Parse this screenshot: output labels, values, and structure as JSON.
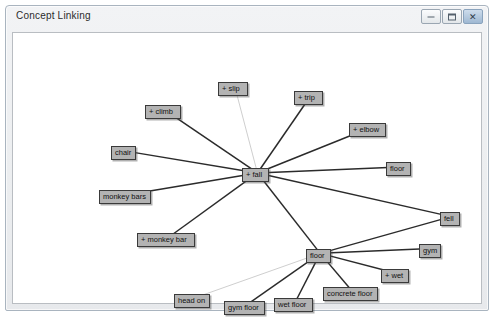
{
  "window": {
    "title": "Concept Linking",
    "controls": [
      {
        "name": "minimize",
        "label": "–"
      },
      {
        "name": "maximize",
        "label": "□"
      },
      {
        "name": "close",
        "label": "✕"
      }
    ]
  },
  "graph": {
    "nodes": [
      {
        "id": "slip",
        "label": "+ slip",
        "x": 212,
        "y": 76,
        "w": 30,
        "hub": false
      },
      {
        "id": "trip",
        "label": "+ trip",
        "x": 288,
        "y": 85,
        "w": 29,
        "hub": false
      },
      {
        "id": "climb",
        "label": "+ climb",
        "x": 139,
        "y": 99,
        "w": 36,
        "hub": false
      },
      {
        "id": "elbow",
        "label": "+ elbow",
        "x": 343,
        "y": 117,
        "w": 37,
        "hub": false
      },
      {
        "id": "chair",
        "label": "chair",
        "x": 105,
        "y": 140,
        "w": 25,
        "hub": false
      },
      {
        "id": "fall",
        "label": "+ fall",
        "x": 236,
        "y": 162,
        "w": 27,
        "hub": true
      },
      {
        "id": "floor_right",
        "label": "floor",
        "x": 380,
        "y": 156,
        "w": 25,
        "hub": false
      },
      {
        "id": "monkey_bars",
        "label": "monkey bars",
        "x": 93,
        "y": 184,
        "w": 52,
        "hub": false
      },
      {
        "id": "monkey_bar",
        "label": "+ monkey bar",
        "x": 131,
        "y": 227,
        "w": 58,
        "hub": false
      },
      {
        "id": "fell",
        "label": "fell",
        "x": 434,
        "y": 206,
        "w": 20,
        "hub": false
      },
      {
        "id": "gym",
        "label": "gym",
        "x": 413,
        "y": 238,
        "w": 22,
        "hub": false
      },
      {
        "id": "floor_hub",
        "label": "floor",
        "x": 300,
        "y": 243,
        "w": 25,
        "hub": true
      },
      {
        "id": "wet",
        "label": "+ wet",
        "x": 375,
        "y": 263,
        "w": 28,
        "hub": false
      },
      {
        "id": "concrete_floor",
        "label": "concrete floor",
        "x": 317,
        "y": 281,
        "w": 55,
        "hub": false
      },
      {
        "id": "wet_floor",
        "label": "wet floor",
        "x": 268,
        "y": 292,
        "w": 39,
        "hub": false
      },
      {
        "id": "gym_floor",
        "label": "gym floor",
        "x": 218,
        "y": 295,
        "w": 41,
        "hub": false
      },
      {
        "id": "head_on",
        "label": "head on",
        "x": 168,
        "y": 288,
        "w": 36,
        "hub": false
      }
    ],
    "edges": [
      {
        "from": "fall",
        "to": "slip",
        "weight": "thin"
      },
      {
        "from": "fall",
        "to": "trip",
        "weight": "thick"
      },
      {
        "from": "fall",
        "to": "climb",
        "weight": "thick"
      },
      {
        "from": "fall",
        "to": "elbow",
        "weight": "thick"
      },
      {
        "from": "fall",
        "to": "chair",
        "weight": "thick"
      },
      {
        "from": "fall",
        "to": "floor_right",
        "weight": "thick"
      },
      {
        "from": "fall",
        "to": "monkey_bars",
        "weight": "thick"
      },
      {
        "from": "fall",
        "to": "monkey_bar",
        "weight": "thick"
      },
      {
        "from": "fall",
        "to": "floor_hub",
        "weight": "thick"
      },
      {
        "from": "fall",
        "to": "fell",
        "weight": "thick"
      },
      {
        "from": "floor_hub",
        "to": "fell",
        "weight": "thick"
      },
      {
        "from": "floor_hub",
        "to": "gym",
        "weight": "thick"
      },
      {
        "from": "floor_hub",
        "to": "wet",
        "weight": "thick"
      },
      {
        "from": "floor_hub",
        "to": "concrete_floor",
        "weight": "thick"
      },
      {
        "from": "floor_hub",
        "to": "wet_floor",
        "weight": "thick"
      },
      {
        "from": "floor_hub",
        "to": "gym_floor",
        "weight": "thick"
      },
      {
        "from": "floor_hub",
        "to": "head_on",
        "weight": "thin"
      }
    ],
    "colors": {
      "node_fill": "#b3b3b3",
      "node_border": "#3a3a3a",
      "edge": "#2b2b2b",
      "edge_faint": "#b8b8b8",
      "canvas": "#ffffff"
    }
  }
}
